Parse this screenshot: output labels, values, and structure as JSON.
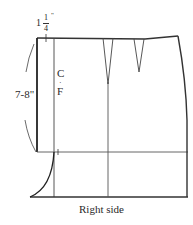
{
  "diagram": {
    "type": "sewing-pattern",
    "labels": {
      "top_measure_whole": "1",
      "top_measure_num": "1",
      "top_measure_den": "4",
      "top_measure_unit": "\"",
      "side_measure": "7-8\"",
      "center_front_c": "C",
      "center_front_f": "F",
      "caption": "Right side"
    },
    "colors": {
      "line": "#333333",
      "thin_line": "#555555",
      "background": "#ffffff"
    }
  }
}
